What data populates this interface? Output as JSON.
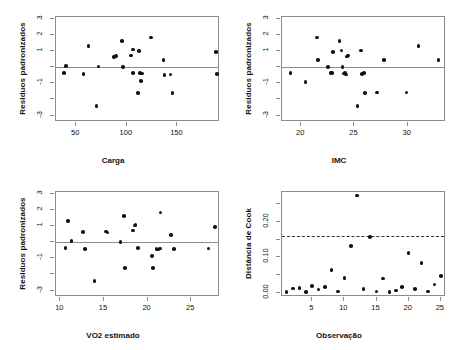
{
  "figure": {
    "title": "",
    "background": "#ffffff",
    "point_color": "#111111",
    "axis_color": "#8c8c8c",
    "panel_layout": "2x2"
  },
  "chart_data": [
    {
      "type": "scatter",
      "panel": "top-left",
      "title": "",
      "xlabel": "Carga",
      "ylabel": "Residuos padronizados",
      "xlim": [
        30,
        192
      ],
      "ylim": [
        -3.4,
        3.1
      ],
      "xticks": [
        50,
        100,
        150
      ],
      "yticks": [
        3,
        2,
        1,
        0,
        -1,
        -2,
        -3
      ],
      "ytick_labels": [
        "3",
        "2",
        "1",
        "",
        "-1",
        "",
        "-3"
      ],
      "grid": false,
      "legend": "none",
      "reference_line": {
        "type": "hline",
        "y": 0,
        "style": "solid"
      },
      "x": [
        38,
        40,
        57,
        62,
        70,
        72,
        87,
        89,
        95,
        96,
        104,
        106,
        106,
        111,
        112,
        113,
        114,
        115,
        124,
        136,
        137,
        143,
        145,
        188,
        189
      ],
      "y": [
        -0.35,
        0.05,
        -0.42,
        1.32,
        -2.42,
        0.04,
        0.62,
        0.68,
        1.62,
        0.02,
        0.72,
        1.08,
        -0.35,
        -1.6,
        0.98,
        -0.38,
        -0.88,
        -0.4,
        1.82,
        0.42,
        -0.48,
        -0.45,
        -1.6,
        0.95,
        -0.42
      ]
    },
    {
      "type": "scatter",
      "panel": "top-right",
      "title": "",
      "xlabel": "IMC",
      "ylabel": "Residuos padronizados",
      "xlim": [
        18.2,
        33.6
      ],
      "ylim": [
        -3.4,
        3.1
      ],
      "xticks": [
        20,
        25,
        30
      ],
      "yticks": [
        3,
        2,
        1,
        0,
        -1,
        -2,
        -3
      ],
      "ytick_labels": [
        "3",
        "2",
        "1",
        "",
        "-1",
        "",
        "-3"
      ],
      "grid": false,
      "legend": "none",
      "reference_line": {
        "type": "hline",
        "y": 0,
        "style": "solid"
      },
      "x": [
        19.0,
        20.4,
        21.5,
        21.6,
        22.5,
        22.8,
        22.9,
        23.0,
        23.6,
        23.8,
        23.9,
        24.0,
        24.1,
        24.2,
        24.3,
        24.4,
        25.3,
        25.6,
        25.7,
        25.9,
        26.0,
        27.1,
        27.8,
        29.9,
        31.0,
        32.9
      ],
      "y": [
        -0.35,
        -0.92,
        1.82,
        0.42,
        0.02,
        -0.38,
        -0.35,
        0.95,
        1.62,
        1.02,
        0.0,
        -0.4,
        -0.35,
        -0.45,
        0.65,
        0.72,
        -2.42,
        1.02,
        -0.42,
        -0.38,
        -1.6,
        -1.58,
        0.45,
        -1.58,
        1.32,
        0.45
      ]
    },
    {
      "type": "scatter",
      "panel": "bottom-left",
      "title": "",
      "xlabel": "VO2 estimado",
      "ylabel": "Residuos padronizados",
      "xlim": [
        9.5,
        28.3
      ],
      "ylim": [
        -3.4,
        3.1
      ],
      "xticks": [
        10,
        15,
        20,
        25
      ],
      "yticks": [
        3,
        2,
        1,
        0,
        -1,
        -2,
        -3
      ],
      "ytick_labels": [
        "3",
        "2",
        "1",
        "",
        "-1",
        "",
        "-3"
      ],
      "grid": false,
      "legend": "none",
      "reference_line": {
        "type": "hline",
        "y": 0,
        "style": "solid"
      },
      "x": [
        10.6,
        10.9,
        11.3,
        12.6,
        12.8,
        13.9,
        15.2,
        15.4,
        16.9,
        17.3,
        17.4,
        18.3,
        18.5,
        18.6,
        18.9,
        20.5,
        20.6,
        21.0,
        21.2,
        21.4,
        21.5,
        22.7,
        23.0,
        27.0,
        27.7
      ],
      "y": [
        -0.35,
        1.32,
        0.05,
        0.62,
        -0.42,
        -2.42,
        0.65,
        0.6,
        0.02,
        1.62,
        -1.6,
        0.72,
        1.02,
        1.05,
        -0.38,
        -0.88,
        -1.62,
        -0.42,
        -0.45,
        -0.4,
        1.82,
        0.42,
        -0.42,
        -0.4,
        0.95
      ]
    },
    {
      "type": "scatter",
      "panel": "bottom-right",
      "title": "",
      "xlabel": "Observação",
      "ylabel": "Distância de Cook",
      "xlim": [
        0.3,
        25.8
      ],
      "ylim": [
        -0.012,
        0.285
      ],
      "xticks": [
        5,
        10,
        15,
        20,
        25
      ],
      "yticks": [
        0.0,
        0.05,
        0.1,
        0.15,
        0.2,
        0.25
      ],
      "ytick_labels": [
        "0.00",
        "",
        "0.10",
        "",
        "0.20",
        ""
      ],
      "grid": false,
      "legend": "none",
      "reference_line": {
        "type": "hline",
        "y": 0.16,
        "style": "dashed"
      },
      "x": [
        1,
        2,
        3,
        4,
        5,
        6,
        7,
        8,
        9,
        10,
        11,
        12,
        13,
        14,
        15,
        16,
        17,
        18,
        19,
        20,
        21,
        22,
        23,
        24,
        25
      ],
      "y": [
        0.002,
        0.012,
        0.013,
        0.002,
        0.019,
        0.009,
        0.016,
        0.065,
        0.004,
        0.042,
        0.132,
        0.275,
        0.011,
        0.157,
        0.004,
        0.04,
        0.002,
        0.006,
        0.016,
        0.113,
        0.01,
        0.085,
        0.004,
        0.023,
        0.047
      ]
    }
  ]
}
